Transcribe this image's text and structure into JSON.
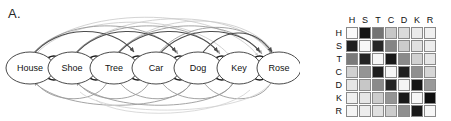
{
  "figure": {
    "panel_a": {
      "letter": "A.",
      "nodes": [
        {
          "id": "H",
          "label": "House"
        },
        {
          "id": "S",
          "label": "Shoe"
        },
        {
          "id": "T",
          "label": "Tree"
        },
        {
          "id": "C",
          "label": "Car"
        },
        {
          "id": "D",
          "label": "Dog"
        },
        {
          "id": "K",
          "label": "Key"
        },
        {
          "id": "R",
          "label": "Rose"
        }
      ],
      "edge_colors": {
        "adjacent": "#1a1a1a",
        "skip_near": "#4d4d4d",
        "skip_mid": "#9a9a9a",
        "skip_far": "#c8c8c8",
        "backward": "#9a9a9a"
      },
      "node_style": {
        "fill": "#ffffff",
        "stroke": "#4a4a4a"
      }
    },
    "panel_b": {
      "letter": "B.",
      "col_headers": [
        "H",
        "S",
        "T",
        "C",
        "D",
        "K",
        "R"
      ],
      "row_headers": [
        "H",
        "S",
        "T",
        "C",
        "D",
        "K",
        "R"
      ],
      "cell_border": "#8a8a8a"
    }
  },
  "chart_data": {
    "type": "heatmap",
    "title": "",
    "xlabel": "",
    "ylabel": "",
    "categories": [
      "H",
      "S",
      "T",
      "C",
      "D",
      "K",
      "R"
    ],
    "x": [
      "H",
      "S",
      "T",
      "C",
      "D",
      "K",
      "R"
    ],
    "y": [
      "H",
      "S",
      "T",
      "C",
      "D",
      "K",
      "R"
    ],
    "colormap": "grayscale-inverted",
    "zlim": [
      0,
      1
    ],
    "grid": true,
    "legend": "none",
    "values": [
      [
        0.02,
        0.92,
        0.55,
        0.22,
        0.14,
        0.08,
        0.06
      ],
      [
        0.88,
        0.03,
        0.85,
        0.48,
        0.2,
        0.12,
        0.07
      ],
      [
        0.52,
        0.86,
        0.03,
        0.9,
        0.46,
        0.18,
        0.1
      ],
      [
        0.18,
        0.42,
        0.88,
        0.03,
        0.88,
        0.44,
        0.16
      ],
      [
        0.1,
        0.22,
        0.46,
        0.86,
        0.04,
        0.92,
        0.4
      ],
      [
        0.06,
        0.1,
        0.2,
        0.42,
        0.9,
        0.03,
        0.94
      ],
      [
        0.04,
        0.07,
        0.12,
        0.2,
        0.44,
        0.9,
        0.03
      ]
    ]
  }
}
